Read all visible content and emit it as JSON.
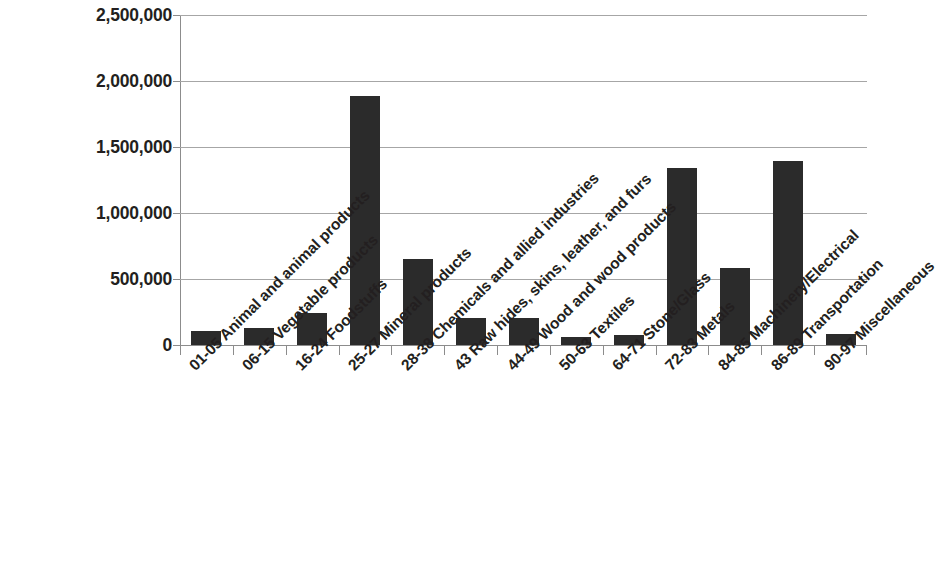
{
  "chart_data": {
    "type": "bar",
    "title": "",
    "subtitle": "",
    "xlabel": "",
    "ylabel": "",
    "ylim": [
      0,
      2500000
    ],
    "grid": true,
    "legend": false,
    "bar_color": "#2b2b2b",
    "gridline_color": "#a6a6a6",
    "axis_color": "#8c8c8c",
    "y_ticks": [
      0,
      500000,
      1000000,
      1500000,
      2000000,
      2500000
    ],
    "y_tick_labels": [
      "0",
      "500,000",
      "1,000,000",
      "1,500,000",
      "2,000,000",
      "2,500,000"
    ],
    "categories": [
      "01-05 Animal and animal products",
      "06-15 Vegetable products",
      "16-24 Foodstuffs",
      "25-27 Mineral products",
      "28-38 Chemicals and allied industries",
      "43 Raw hides, skins, leather, and furs",
      "44-49 Wood and wood products",
      "50-63 Textiles",
      "64-71 Stone/Glass",
      "72-83 Metals",
      "84-85 Machinery/Electrical",
      "86-89 Transportation",
      "90-97 Miscellaneous"
    ],
    "values": [
      105000,
      130000,
      240000,
      1890000,
      655000,
      205000,
      205000,
      60000,
      75000,
      1340000,
      585000,
      1395000,
      85000
    ]
  }
}
